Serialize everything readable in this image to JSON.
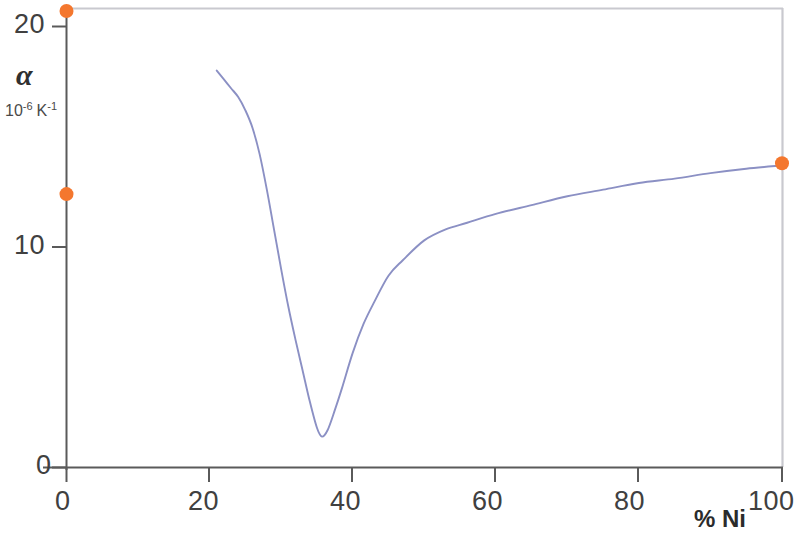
{
  "chart_data": {
    "type": "line",
    "title": "",
    "xlabel": "% Ni",
    "ylabel": "α",
    "ylabel_symbol": "α",
    "ylabel_units_base": "10",
    "ylabel_units_exp1": "-6",
    "ylabel_units_k": "K",
    "ylabel_units_exp2": "-1",
    "xlim": [
      0,
      100
    ],
    "ylim": [
      0,
      21.5
    ],
    "grid": false,
    "legend": "none",
    "xticks": [
      "0",
      "20",
      "40",
      "60",
      "80",
      "100"
    ],
    "xtick_values": [
      0,
      20,
      40,
      60,
      80,
      100
    ],
    "yticks": [
      "0",
      "10",
      "20"
    ],
    "ytick_values": [
      0,
      10,
      20
    ],
    "series": [
      {
        "name": "Thermal expansion coefficient curve",
        "type": "line",
        "color": "#8b90c4",
        "x": [
          21.0,
          22.0,
          23.0,
          24.0,
          25.0,
          26.0,
          27.0,
          28.0,
          29.0,
          30.0,
          31.0,
          32.0,
          33.0,
          34.0,
          35.0,
          35.7,
          36.5,
          37.5,
          38.5,
          40.0,
          41.5,
          43.0,
          45.0,
          47.0,
          50.0,
          53.0,
          56.0,
          60.0,
          65.0,
          70.0,
          75.0,
          80.0,
          85.0,
          90.0,
          95.0,
          100.0
        ],
        "y": [
          18.0,
          17.6,
          17.2,
          16.8,
          16.2,
          15.4,
          14.2,
          12.6,
          10.8,
          9.0,
          7.3,
          5.8,
          4.4,
          3.0,
          1.8,
          1.4,
          1.7,
          2.6,
          3.6,
          5.2,
          6.5,
          7.5,
          8.7,
          9.4,
          10.3,
          10.8,
          11.1,
          11.5,
          11.9,
          12.3,
          12.6,
          12.9,
          13.1,
          13.35,
          13.55,
          13.7
        ]
      },
      {
        "name": "Measured endpoint markers",
        "type": "scatter",
        "color": "#f4772e",
        "points": [
          {
            "x": 0,
            "y": 20.7
          },
          {
            "x": 0,
            "y": 12.4
          },
          {
            "x": 100,
            "y": 13.8
          }
        ]
      }
    ],
    "axis_color": "#545454",
    "frame_color": "#c9c9cf",
    "background": "#ffffff"
  },
  "axes": {
    "y_ticklabel_20": "20",
    "y_ticklabel_10": "10",
    "y_ticklabel_0": "0",
    "x_ticklabel_0": "0",
    "x_ticklabel_20": "20",
    "x_ticklabel_40": "40",
    "x_ticklabel_60": "60",
    "x_ticklabel_80": "80",
    "x_ticklabel_100": "100",
    "x_axis_title": "% Ni",
    "y_axis_symbol": "α",
    "y_units_base": "10",
    "y_units_exp1": "-6",
    "y_units_k": "K",
    "y_units_exp2": "-1"
  }
}
